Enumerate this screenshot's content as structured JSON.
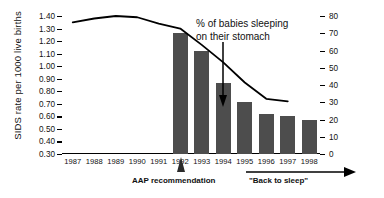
{
  "chart_data": {
    "type": "bar",
    "title": "",
    "xlabel": "",
    "ylabel": "SIDS rate per 1000 live births",
    "y2label": "% of babies sleeping on their stomach",
    "categories": [
      "1987",
      "1988",
      "1989",
      "1990",
      "1991",
      "1992",
      "1993",
      "1994",
      "1995",
      "1996",
      "1997",
      "1998"
    ],
    "ylim": [
      0.3,
      1.4
    ],
    "y2lim": [
      0,
      80
    ],
    "yticks": [
      "1.40",
      "1.30",
      "1.20",
      "1.10",
      "1.00",
      "0.90",
      "0.80",
      "0.70",
      "0.60",
      "0.50",
      "0.40",
      "0.30"
    ],
    "ytick_values": [
      1.4,
      1.3,
      1.2,
      1.1,
      1.0,
      0.9,
      0.8,
      0.7,
      0.6,
      0.5,
      0.4,
      0.3
    ],
    "y2ticks": [
      "80",
      "70",
      "60",
      "50",
      "40",
      "30",
      "20",
      "10",
      "0"
    ],
    "y2tick_values": [
      80,
      70,
      60,
      50,
      40,
      30,
      20,
      10,
      0
    ],
    "grid": false,
    "legend": "none",
    "series": [
      {
        "name": "% of babies sleeping on their stomach",
        "type": "bar",
        "axis": "right",
        "color": "#4d4d4d",
        "x": [
          "1992",
          "1993",
          "1994",
          "1995",
          "1996",
          "1997",
          "1998"
        ],
        "values": [
          70,
          60,
          41,
          30,
          23,
          22,
          20
        ]
      },
      {
        "name": "SIDS rate per 1000 live births",
        "type": "line",
        "axis": "left",
        "color": "#000000",
        "x": [
          "1987",
          "1988",
          "1989",
          "1990",
          "1991",
          "1992",
          "1993",
          "1994",
          "1995",
          "1996",
          "1997"
        ],
        "values": [
          1.35,
          1.38,
          1.4,
          1.39,
          1.34,
          1.3,
          1.17,
          1.03,
          0.87,
          0.74,
          0.72
        ]
      }
    ],
    "annotations": [
      {
        "name": "stomach-sleeping-callout",
        "text": "% of babies sleeping\non their stomach",
        "line1": "% of babies sleeping",
        "line2": "on their stomach"
      },
      {
        "name": "aap-recommendation",
        "text": "AAP recommendation",
        "at_category": "1992"
      },
      {
        "name": "back-to-sleep",
        "text": "\"Back to sleep\"",
        "from_category": "1995",
        "to_category": "1998"
      }
    ]
  }
}
